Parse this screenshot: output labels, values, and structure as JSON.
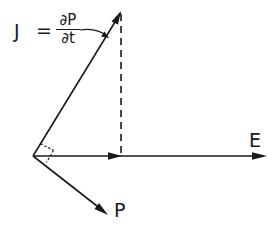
{
  "diagram": {
    "labels": {
      "J": "J",
      "equals": "=",
      "numerator": "∂P",
      "denominator": "∂t",
      "E": "E",
      "P": "P"
    },
    "vectors": [
      {
        "name": "J",
        "from": [
          33,
          156
        ],
        "to": [
          121,
          12
        ]
      },
      {
        "name": "E",
        "from": [
          33,
          156
        ],
        "to": [
          266,
          156
        ]
      },
      {
        "name": "P",
        "from": [
          33,
          156
        ],
        "to": [
          107,
          214
        ]
      }
    ],
    "projection": {
      "style": "dashed",
      "from": [
        121,
        12
      ],
      "to": [
        121,
        156
      ]
    },
    "right_angle_marker": {
      "between": [
        "J",
        "P"
      ],
      "style": "dashed"
    },
    "colors": {
      "ink": "#1a1a1a",
      "background": "#ffffff"
    }
  }
}
